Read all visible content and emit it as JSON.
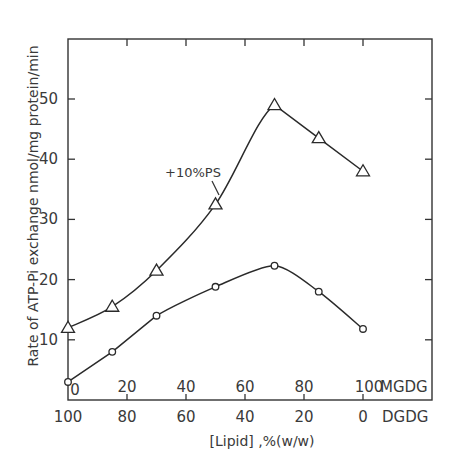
{
  "chart_data": {
    "type": "line",
    "title": "",
    "ylabel": "Rate of ATP-Pi exchange nmol/mg protein/min",
    "xlabel": "[Lipid] ,%(w/w)",
    "x_axis_top_series_label": "MGDG",
    "x_axis_bottom_series_label": "DGDG",
    "ylim": [
      0,
      60
    ],
    "xlim": [
      0,
      125
    ],
    "grid": false,
    "legend_position": "none",
    "y_ticks": [
      10,
      20,
      30,
      40,
      50
    ],
    "x_ticks_mgdg": [
      "0",
      "20",
      "40",
      "60",
      "80",
      "100"
    ],
    "x_ticks_dgdg": [
      "100",
      "80",
      "60",
      "40",
      "20",
      "0"
    ],
    "x": [
      0,
      15,
      30,
      50,
      70,
      85,
      100
    ],
    "series": [
      {
        "name": "+10%PS",
        "marker": "triangle",
        "values": [
          12,
          15.5,
          21.5,
          32.5,
          49,
          43.5,
          38
        ]
      },
      {
        "name": "no PS",
        "marker": "circle",
        "values": [
          3,
          8,
          14,
          18.8,
          22.3,
          18,
          11.8
        ]
      }
    ],
    "annotations": [
      {
        "text": "+10%PS",
        "points_to_series": "+10%PS",
        "x": 50,
        "y": 32.5
      }
    ]
  },
  "labels": {
    "y_axis": "Rate of ATP-Pi exchange nmol/mg protein/min",
    "x_axis": "[Lipid] ,%(w/w)",
    "mgdg": "MGDG",
    "dgdg": "DGDG",
    "annotation": "+10%PS",
    "y_ticks": [
      "10",
      "20",
      "30",
      "40",
      "50"
    ],
    "x_ticks_mgdg": [
      "0",
      "20",
      "40",
      "60",
      "80",
      "100"
    ],
    "x_ticks_dgdg": [
      "100",
      "80",
      "60",
      "40",
      "20",
      "0"
    ]
  }
}
